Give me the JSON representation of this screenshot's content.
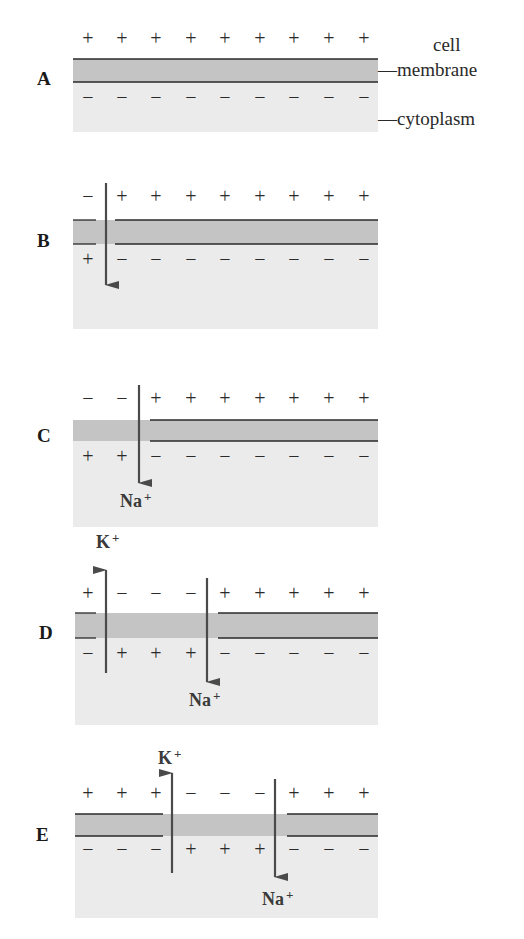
{
  "figure": {
    "colors": {
      "background": "#ffffff",
      "membrane": "#c4c4c4",
      "cytoplasm": "#ebebeb",
      "line": "#2a2a2a",
      "arrow": "#4a4a4a",
      "text": "#2a2a2a"
    },
    "labels": {
      "cell": "cell",
      "membrane": "—membrane",
      "cytoplasm": "—cytoplasm"
    },
    "ions": {
      "sodium": "Na",
      "potassium": "K",
      "charge": "+"
    },
    "panels": [
      {
        "id": "A",
        "label": "A",
        "outside": [
          "+",
          "+",
          "+",
          "+",
          "+",
          "+",
          "+",
          "+",
          "+"
        ],
        "inside": [
          "−",
          "−",
          "−",
          "−",
          "−",
          "−",
          "−",
          "−",
          "−"
        ],
        "arrows": []
      },
      {
        "id": "B",
        "label": "B",
        "outside": [
          "−",
          "+",
          "+",
          "+",
          "+",
          "+",
          "+",
          "+",
          "+"
        ],
        "inside": [
          "+",
          "−",
          "−",
          "−",
          "−",
          "−",
          "−",
          "−",
          "−"
        ],
        "arrows": [
          {
            "ion": "Na+",
            "direction": "in",
            "label_shown": false
          }
        ]
      },
      {
        "id": "C",
        "label": "C",
        "outside": [
          "−",
          "−",
          "+",
          "+",
          "+",
          "+",
          "+",
          "+",
          "+"
        ],
        "inside": [
          "+",
          "+",
          "−",
          "−",
          "−",
          "−",
          "−",
          "−",
          "−"
        ],
        "arrows": [
          {
            "ion": "Na+",
            "direction": "in",
            "label_shown": true
          }
        ]
      },
      {
        "id": "D",
        "label": "D",
        "outside": [
          "+",
          "−",
          "−",
          "−",
          "+",
          "+",
          "+",
          "+",
          "+"
        ],
        "inside": [
          "−",
          "+",
          "+",
          "+",
          "−",
          "−",
          "−",
          "−",
          "−"
        ],
        "arrows": [
          {
            "ion": "K+",
            "direction": "out",
            "label_shown": true
          },
          {
            "ion": "Na+",
            "direction": "in",
            "label_shown": true
          }
        ]
      },
      {
        "id": "E",
        "label": "E",
        "outside": [
          "+",
          "+",
          "+",
          "−",
          "−",
          "−",
          "+",
          "+",
          "+"
        ],
        "inside": [
          "−",
          "−",
          "−",
          "+",
          "+",
          "+",
          "−",
          "−",
          "−"
        ],
        "arrows": [
          {
            "ion": "K+",
            "direction": "out",
            "label_shown": true
          },
          {
            "ion": "Na+",
            "direction": "in",
            "label_shown": true
          }
        ]
      }
    ]
  }
}
